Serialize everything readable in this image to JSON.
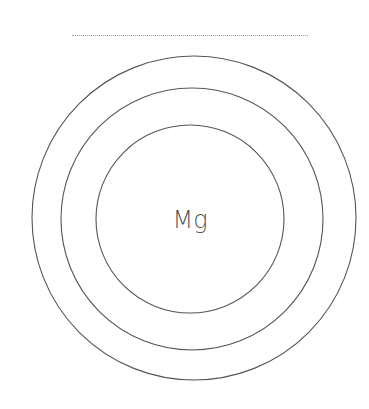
{
  "diagram": {
    "element_symbol": "Mg",
    "shell_count": 3,
    "stroke_color": "#555555",
    "text_color": "#555555"
  }
}
